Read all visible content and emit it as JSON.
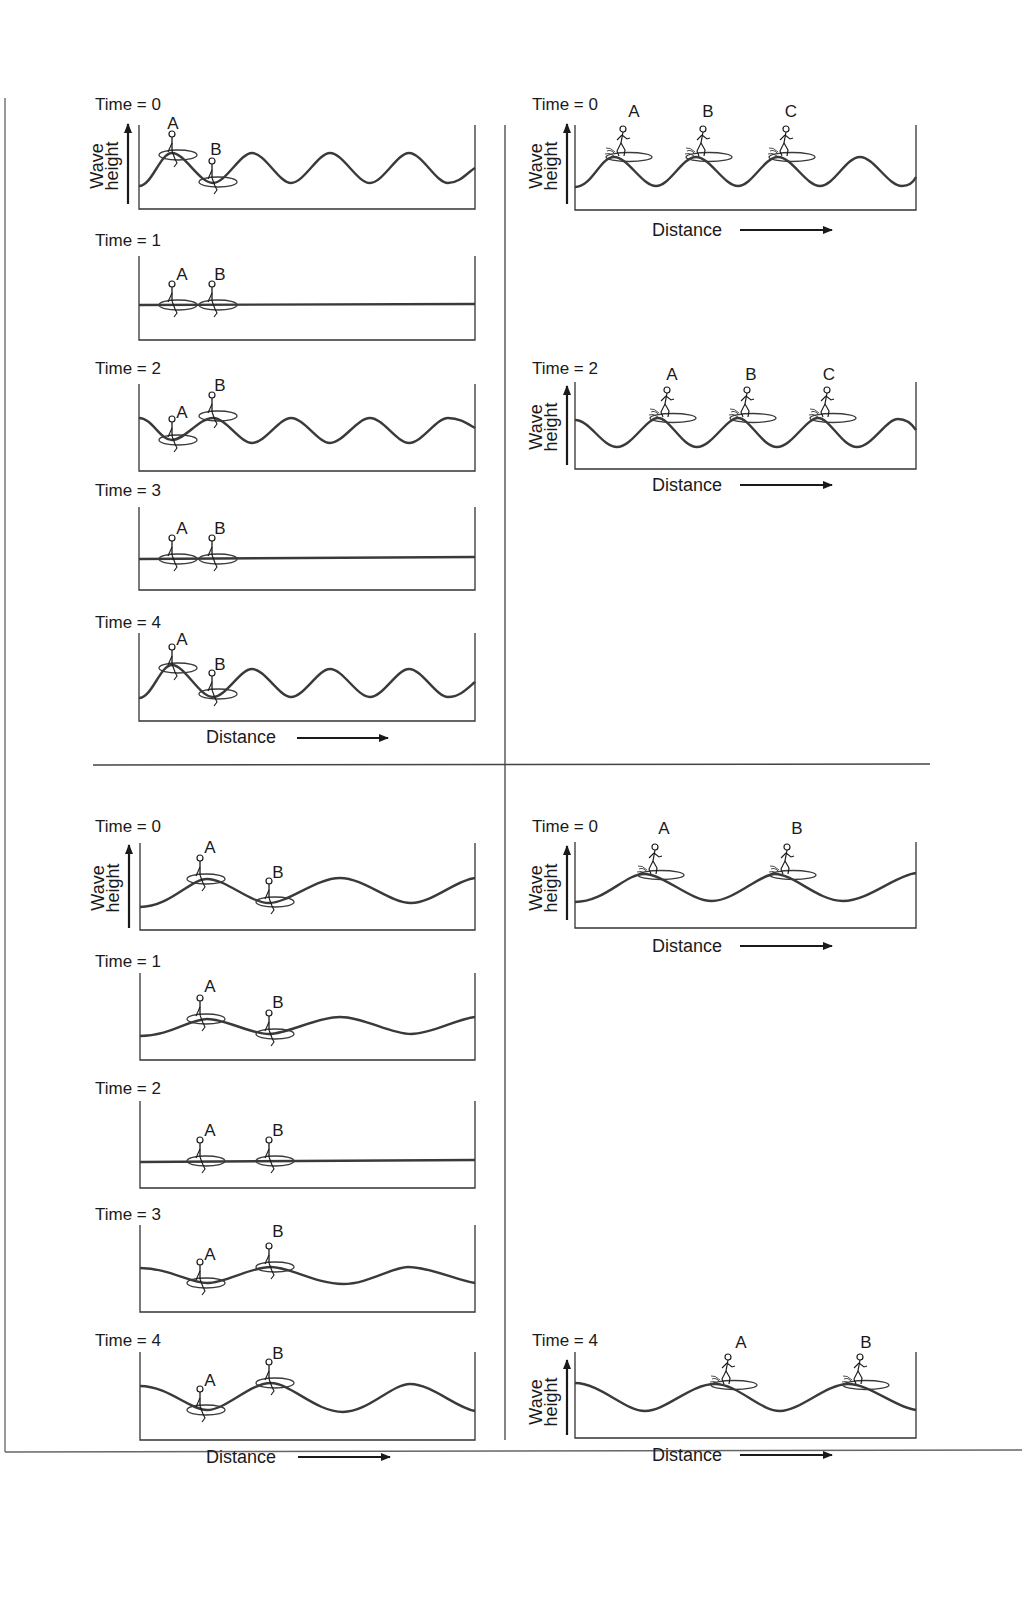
{
  "figure": {
    "colors": {
      "stroke": "#3a3a3a",
      "text": "#1a1a1a",
      "background": "#ffffff"
    },
    "axis_labels": {
      "y_line1": "Wave",
      "y_line2": "height",
      "x": "Distance"
    },
    "quadrants": [
      {
        "id": "top-left",
        "title": "Short wavelength – floaters",
        "panels": [
          {
            "time_label": "Time = 0",
            "amplitude": 15,
            "phase": 0,
            "wavelength": 118,
            "figures": [
              {
                "label": "A",
                "x": 172,
                "type": "floater"
              },
              {
                "label": "B",
                "x": 213,
                "type": "floater"
              }
            ]
          },
          {
            "time_label": "Time = 1",
            "amplitude": 0,
            "phase": 0,
            "wavelength": 118,
            "figures": [
              {
                "label": "A",
                "x": 172,
                "type": "floater"
              },
              {
                "label": "B",
                "x": 213,
                "type": "floater"
              }
            ]
          },
          {
            "time_label": "Time = 2",
            "amplitude": -15,
            "phase": 0,
            "wavelength": 118,
            "figures": [
              {
                "label": "A",
                "x": 172,
                "type": "floater"
              },
              {
                "label": "B",
                "x": 213,
                "type": "floater"
              }
            ]
          },
          {
            "time_label": "Time = 3",
            "amplitude": 0,
            "phase": 0,
            "wavelength": 118,
            "figures": [
              {
                "label": "A",
                "x": 172,
                "type": "floater"
              },
              {
                "label": "B",
                "x": 213,
                "type": "floater"
              }
            ]
          },
          {
            "time_label": "Time = 4",
            "amplitude": 15,
            "phase": 0,
            "wavelength": 118,
            "figures": [
              {
                "label": "A",
                "x": 172,
                "type": "floater"
              },
              {
                "label": "B",
                "x": 213,
                "type": "floater"
              }
            ]
          }
        ]
      },
      {
        "id": "top-right",
        "title": "Short wavelength – surfers",
        "panels": [
          {
            "time_label": "Time = 0",
            "figures": [
              {
                "label": "A",
                "type": "surfer"
              },
              {
                "label": "B",
                "type": "surfer"
              },
              {
                "label": "C",
                "type": "surfer"
              }
            ]
          },
          {
            "time_label": "Time = 2",
            "figures": [
              {
                "label": "A",
                "type": "surfer"
              },
              {
                "label": "B",
                "type": "surfer"
              },
              {
                "label": "C",
                "type": "surfer"
              }
            ]
          }
        ]
      },
      {
        "id": "bottom-left",
        "title": "Long wavelength – floaters",
        "panels": [
          {
            "time_label": "Time = 0",
            "figures": [
              {
                "label": "A",
                "type": "floater"
              },
              {
                "label": "B",
                "type": "floater"
              }
            ]
          },
          {
            "time_label": "Time = 1",
            "figures": [
              {
                "label": "A",
                "type": "floater"
              },
              {
                "label": "B",
                "type": "floater"
              }
            ]
          },
          {
            "time_label": "Time = 2",
            "figures": [
              {
                "label": "A",
                "type": "floater"
              },
              {
                "label": "B",
                "type": "floater"
              }
            ]
          },
          {
            "time_label": "Time = 3",
            "figures": [
              {
                "label": "A",
                "type": "floater"
              },
              {
                "label": "B",
                "type": "floater"
              }
            ]
          },
          {
            "time_label": "Time = 4",
            "figures": [
              {
                "label": "A",
                "type": "floater"
              },
              {
                "label": "B",
                "type": "floater"
              }
            ]
          }
        ]
      },
      {
        "id": "bottom-right",
        "title": "Long wavelength – surfers",
        "panels": [
          {
            "time_label": "Time = 0",
            "figures": [
              {
                "label": "A",
                "type": "surfer"
              },
              {
                "label": "B",
                "type": "surfer"
              }
            ]
          },
          {
            "time_label": "Time = 4",
            "figures": [
              {
                "label": "A",
                "type": "surfer"
              },
              {
                "label": "B",
                "type": "surfer"
              }
            ]
          }
        ]
      }
    ]
  },
  "labels": {
    "tl": {
      "t0": "Time = 0",
      "t1": "Time = 1",
      "t2": "Time = 2",
      "t3": "Time = 3",
      "t4": "Time = 4",
      "A": "A",
      "B": "B"
    },
    "tr": {
      "t0": "Time = 0",
      "t2": "Time = 2",
      "A": "A",
      "B": "B",
      "C": "C"
    },
    "bl": {
      "t0": "Time = 0",
      "t1": "Time = 1",
      "t2": "Time = 2",
      "t3": "Time = 3",
      "t4": "Time = 4",
      "A": "A",
      "B": "B"
    },
    "br": {
      "t0": "Time = 0",
      "t4": "Time = 4",
      "A": "A",
      "B": "B"
    },
    "wave": "Wave",
    "height": "height",
    "distance": "Distance"
  }
}
